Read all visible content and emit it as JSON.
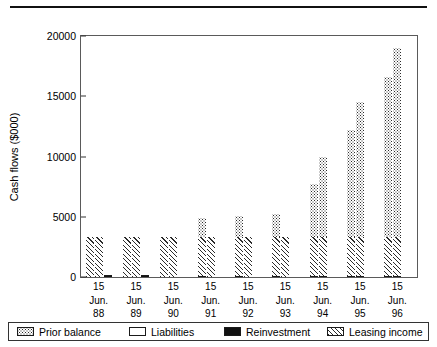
{
  "chart_data": {
    "type": "bar",
    "title": "",
    "subtitle": "",
    "xlabel": "",
    "ylabel": "Cash flows ($000)",
    "ylim": [
      0,
      20000
    ],
    "yticks": [
      0,
      5000,
      10000,
      15000,
      20000
    ],
    "ytick_labels": [
      "0",
      "5000",
      "10000",
      "15000",
      "20000"
    ],
    "grid": false,
    "legend_position": "bottom",
    "categories": [
      "15 Jun. 88",
      "15 Jun. 89",
      "15 Jun. 90",
      "15 Jun. 91",
      "15 Jun. 92",
      "15 Jun. 93",
      "15 Jun. 94",
      "15 Jun. 95",
      "15 Jun. 96"
    ],
    "category_lines": [
      [
        "15",
        "Jun.",
        "88"
      ],
      [
        "15",
        "Jun.",
        "89"
      ],
      [
        "15",
        "Jun.",
        "90"
      ],
      [
        "15",
        "Jun.",
        "91"
      ],
      [
        "15",
        "Jun.",
        "92"
      ],
      [
        "15",
        "Jun.",
        "93"
      ],
      [
        "15",
        "Jun.",
        "94"
      ],
      [
        "15",
        "Jun.",
        "95"
      ],
      [
        "15",
        "Jun.",
        "96"
      ]
    ],
    "series": [
      {
        "name": "Prior balance",
        "pattern": "dotted",
        "values": [
          3200,
          3200,
          3200,
          4900,
          5050,
          5200,
          7700,
          12200,
          16600
        ]
      },
      {
        "name": "Liabilities",
        "pattern": "white",
        "values": [
          3200,
          3200,
          3200,
          4900,
          5050,
          5200,
          10000,
          14500,
          19000
        ]
      },
      {
        "name": "Reinvestment",
        "pattern": "solid-black",
        "values": [
          0,
          0,
          0,
          320,
          350,
          370,
          420,
          450,
          480
        ]
      },
      {
        "name": "Leasing income",
        "pattern": "diagonal-hatch",
        "values": [
          3200,
          3200,
          3200,
          3200,
          3200,
          3200,
          3200,
          3200,
          3200
        ]
      }
    ],
    "groups": [
      {
        "category": "15 Jun. 88",
        "bars": [
          {
            "series": "Leasing income",
            "value": 3200,
            "base": 0,
            "top_series": null,
            "top_value": 0
          },
          {
            "series": "Leasing income",
            "value": 3200,
            "base": 0,
            "top_series": null,
            "top_value": 0
          },
          {
            "series": "Reinvestment",
            "value": 0,
            "base": 0,
            "top_series": null,
            "top_value": 0
          }
        ]
      },
      {
        "category": "15 Jun. 89",
        "bars": [
          {
            "series": "Leasing income",
            "value": 3200,
            "base": 0,
            "top_series": null,
            "top_value": 0
          },
          {
            "series": "Leasing income",
            "value": 3200,
            "base": 0,
            "top_series": null,
            "top_value": 0
          },
          {
            "series": "Reinvestment",
            "value": 0,
            "base": 0,
            "top_series": null,
            "top_value": 0
          }
        ]
      },
      {
        "category": "15 Jun. 90",
        "bars": [
          {
            "series": "Leasing income",
            "value": 3200,
            "base": 0,
            "top_series": null,
            "top_value": 0
          },
          {
            "series": "Leasing income",
            "value": 3200,
            "base": 0,
            "top_series": null,
            "top_value": 0
          },
          {
            "series": "Liabilities",
            "value": 1450,
            "base": 0,
            "top_series": null,
            "top_value": 0
          }
        ]
      },
      {
        "category": "15 Jun. 91",
        "bars": [
          {
            "series": "Leasing income",
            "value": 3200,
            "base": 0,
            "top_series": "Prior balance",
            "top_value": 4900
          },
          {
            "series": "Leasing income",
            "value": 3200,
            "base": 0,
            "top_series": null,
            "top_value": 0
          },
          {
            "series": "Liabilities",
            "value": 1500,
            "base": 0,
            "top_series": null,
            "top_value": 0
          }
        ]
      },
      {
        "category": "15 Jun. 92",
        "bars": [
          {
            "series": "Leasing income",
            "value": 3200,
            "base": 0,
            "top_series": "Prior balance",
            "top_value": 5050
          },
          {
            "series": "Leasing income",
            "value": 3200,
            "base": 0,
            "top_series": null,
            "top_value": 0
          },
          {
            "series": "Liabilities",
            "value": 1150,
            "base": 0,
            "top_series": null,
            "top_value": 0
          }
        ]
      },
      {
        "category": "15 Jun. 93",
        "bars": [
          {
            "series": "Leasing income",
            "value": 3200,
            "base": 0,
            "top_series": "Prior balance",
            "top_value": 5200
          },
          {
            "series": "Leasing income",
            "value": 3200,
            "base": 0,
            "top_series": null,
            "top_value": 0
          },
          {
            "series": "Liabilities",
            "value": 950,
            "base": 0,
            "top_series": null,
            "top_value": 0
          }
        ]
      },
      {
        "category": "15 Jun. 94",
        "bars": [
          {
            "series": "Leasing income",
            "value": 3200,
            "base": 0,
            "top_series": "Prior balance",
            "top_value": 7700
          },
          {
            "series": "Leasing income",
            "value": 3200,
            "base": 0,
            "top_series": "Prior balance",
            "top_value": 10000
          },
          {
            "series": "Liabilities",
            "value": 950,
            "base": 0,
            "top_series": null,
            "top_value": 0
          }
        ]
      },
      {
        "category": "15 Jun. 95",
        "bars": [
          {
            "series": "Leasing income",
            "value": 3200,
            "base": 0,
            "top_series": "Prior balance",
            "top_value": 12200
          },
          {
            "series": "Leasing income",
            "value": 3200,
            "base": 0,
            "top_series": "Prior balance",
            "top_value": 14500
          },
          {
            "series": "Liabilities",
            "value": 950,
            "base": 0,
            "top_series": null,
            "top_value": 0
          }
        ]
      },
      {
        "category": "15 Jun. 96",
        "bars": [
          {
            "series": "Leasing income",
            "value": 3200,
            "base": 0,
            "top_series": "Prior balance",
            "top_value": 16600
          },
          {
            "series": "Leasing income",
            "value": 3200,
            "base": 0,
            "top_series": "Prior balance",
            "top_value": 19000
          },
          {
            "series": "Liabilities",
            "value": 950,
            "base": 0,
            "top_series": null,
            "top_value": 0
          }
        ]
      }
    ],
    "legend": [
      {
        "label": "Prior balance",
        "pattern": "dotted"
      },
      {
        "label": "Liabilities",
        "pattern": "white"
      },
      {
        "label": "Reinvestment",
        "pattern": "solid-black"
      },
      {
        "label": "Leasing income",
        "pattern": "diagonal-hatch"
      }
    ],
    "colors": {
      "ink": "#1a1a1a",
      "axis": "#5a5a5a",
      "background": "#ffffff"
    }
  }
}
